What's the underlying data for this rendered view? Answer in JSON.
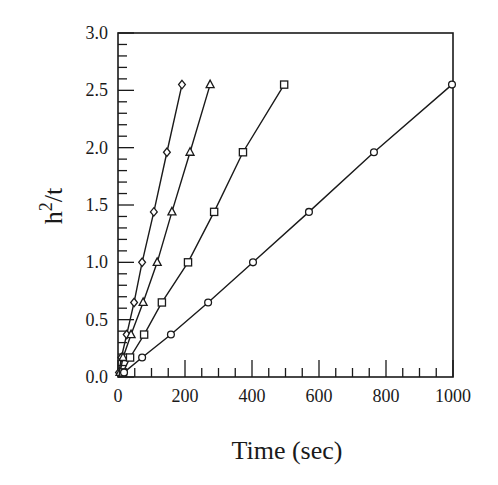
{
  "chart_data": {
    "type": "line",
    "title": "",
    "xlabel": "Time (sec)",
    "ylabel": "h²/t",
    "ylabel_base": "h",
    "ylabel_sup": "2",
    "ylabel_rest": "/t",
    "xlim": [
      0,
      1000
    ],
    "ylim": [
      0.0,
      3.0
    ],
    "xticks": [
      0,
      200,
      400,
      600,
      800,
      1000
    ],
    "xtick_labels": [
      "0",
      "200",
      "400",
      "600",
      "800",
      "1000"
    ],
    "yticks": [
      0.0,
      0.5,
      1.0,
      1.5,
      2.0,
      2.5,
      3.0
    ],
    "ytick_labels": [
      "0.0",
      "0.5",
      "1.0",
      "1.5",
      "2.0",
      "2.5",
      "3.0"
    ],
    "grid": false,
    "legend": null,
    "series": [
      {
        "name": "diamond",
        "marker": "diamond",
        "x": [
          3,
          10,
          26,
          48,
          72,
          107,
          146,
          191
        ],
        "y": [
          0.04,
          0.17,
          0.37,
          0.65,
          1.0,
          1.44,
          1.96,
          2.55
        ]
      },
      {
        "name": "triangle",
        "marker": "triangle",
        "x": [
          6,
          15,
          39,
          75,
          117,
          161,
          215,
          275
        ],
        "y": [
          0.04,
          0.17,
          0.37,
          0.65,
          1.0,
          1.44,
          1.96,
          2.55
        ]
      },
      {
        "name": "square",
        "marker": "square",
        "x": [
          15,
          36,
          78,
          131,
          209,
          287,
          373,
          496
        ],
        "y": [
          0.04,
          0.17,
          0.37,
          0.65,
          1.0,
          1.44,
          1.96,
          2.55
        ]
      },
      {
        "name": "circle",
        "marker": "circle",
        "x": [
          18,
          72,
          158,
          269,
          403,
          570,
          764,
          997
        ],
        "y": [
          0.04,
          0.17,
          0.37,
          0.65,
          1.0,
          1.44,
          1.96,
          2.55
        ]
      }
    ]
  }
}
